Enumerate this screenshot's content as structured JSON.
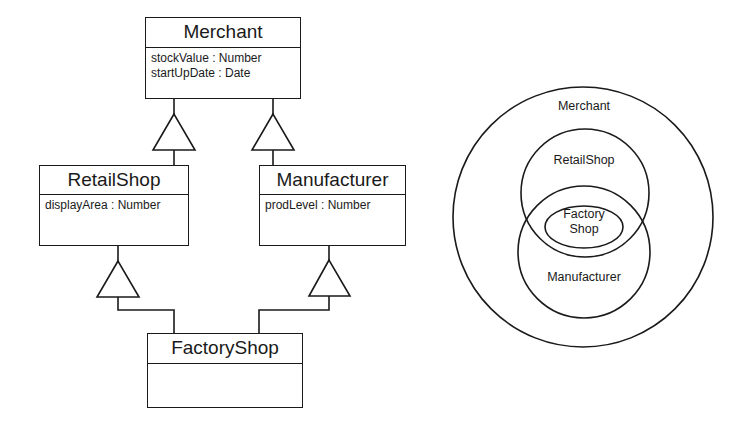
{
  "uml": {
    "classes": {
      "merchant": {
        "name": "Merchant",
        "attributes": [
          "stockValue : Number",
          "startUpDate : Date"
        ]
      },
      "retailshop": {
        "name": "RetailShop",
        "attributes": [
          "displayArea : Number"
        ]
      },
      "manufacturer": {
        "name": "Manufacturer",
        "attributes": [
          "prodLevel : Number"
        ]
      },
      "factoryshop": {
        "name": "FactoryShop",
        "attributes": []
      }
    },
    "generalizations": [
      {
        "child": "RetailShop",
        "parent": "Merchant"
      },
      {
        "child": "Manufacturer",
        "parent": "Merchant"
      },
      {
        "child": "FactoryShop",
        "parent": "RetailShop"
      },
      {
        "child": "FactoryShop",
        "parent": "Manufacturer"
      }
    ]
  },
  "venn": {
    "outer_label": "Merchant",
    "retail_label": "RetailShop",
    "manufacturer_label": "Manufacturer",
    "factory_label_line1": "Factory",
    "factory_label_line2": "Shop"
  },
  "colors": {
    "stroke": "#1a1a1a",
    "background": "#ffffff"
  }
}
